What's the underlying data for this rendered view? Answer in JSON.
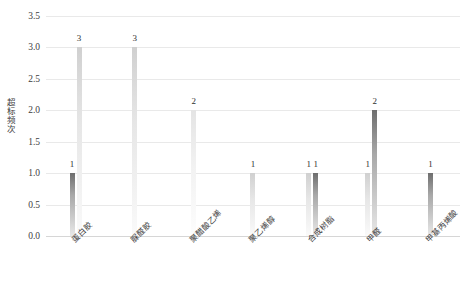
{
  "chart_data": {
    "type": "bar",
    "title": "",
    "xlabel": "",
    "ylabel": "超标频次",
    "ylim": [
      0.0,
      3.5
    ],
    "yticks": [
      "0.0",
      "0.5",
      "1.0",
      "1.5",
      "2.0",
      "2.5",
      "3.0",
      "3.5"
    ],
    "grid": true,
    "legend": "none",
    "categories": [
      "蛋白胶",
      "脲醛胶",
      "聚醋酸乙烯",
      "聚乙烯醇",
      "合成树脂",
      "甲醛",
      "甲基丙烯酸"
    ],
    "series": [
      {
        "name": "series-a",
        "color": "#8f8f8f",
        "values": [
          1,
          null,
          null,
          null,
          1,
          1,
          1
        ]
      },
      {
        "name": "series-b",
        "color": "#d8d8d8",
        "values": [
          3,
          3,
          2,
          1,
          1,
          2,
          null
        ]
      }
    ],
    "groups": [
      {
        "label": "蛋白胶",
        "bars": [
          {
            "value": 1,
            "label": "1",
            "shade": "dark"
          },
          {
            "value": 3,
            "label": "3",
            "shade": "light"
          }
        ]
      },
      {
        "label": "脲醛胶",
        "bars": [
          {
            "value": 3,
            "label": "3",
            "shade": "light"
          }
        ]
      },
      {
        "label": "聚醋酸乙烯",
        "bars": [
          {
            "value": 2,
            "label": "2",
            "shade": "pale"
          }
        ]
      },
      {
        "label": "聚乙烯醇",
        "bars": [
          {
            "value": 1,
            "label": "1",
            "shade": "light"
          }
        ]
      },
      {
        "label": "合成树脂",
        "bars": [
          {
            "value": 1,
            "label": "1",
            "shade": "light"
          },
          {
            "value": 1,
            "label": "1",
            "shade": "dark"
          }
        ]
      },
      {
        "label": "甲醛",
        "bars": [
          {
            "value": 1,
            "label": "1",
            "shade": "light"
          },
          {
            "value": 2,
            "label": "2",
            "shade": "dark"
          }
        ]
      },
      {
        "label": "甲基丙烯酸",
        "bars": [
          {
            "value": 1,
            "label": "1",
            "shade": "dark"
          }
        ]
      }
    ],
    "colors": {
      "dark_top": "#6e6e6e",
      "dark_bottom": "#e8e8e8",
      "light_top": "#d0d0d0",
      "light_bottom": "#fafafa",
      "pale_top": "#e4e4e4",
      "pale_bottom": "#fdfdfd",
      "gridline": "#e9e9e9",
      "text": "#3a3a3a"
    }
  }
}
